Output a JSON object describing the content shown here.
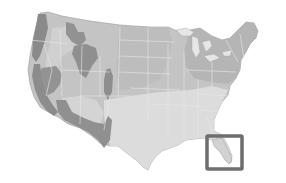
{
  "map": {
    "title": "Continental United States climate zone map",
    "colors": {
      "background": "#ffffff",
      "light_zone": "#d6d6d6",
      "mid_zone": "#b9b9b9",
      "dark_zone": "#8f8f8f",
      "darkest_zone": "#7a7a7a",
      "state_border": "#e8e8e8",
      "highlight_box": "#6e6e6e"
    },
    "highlight": {
      "region": "Florida",
      "x": 207,
      "y": 136,
      "width": 35,
      "height": 33
    }
  }
}
